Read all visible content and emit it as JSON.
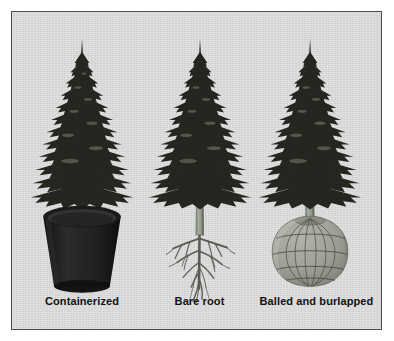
{
  "figure": {
    "background_color": "#d9d9d9",
    "border_color": "#4a4a4a",
    "outer_background": "#ffffff"
  },
  "colors": {
    "foliage_dark": "#23241f",
    "foliage_mid": "#3a3c33",
    "foliage_highlight": "#6d7063",
    "trunk": "#9aa091",
    "trunk_shadow": "#757b6d",
    "pot_dark": "#202020",
    "pot_rim": "#151515",
    "pot_soil": "#2c2c2c",
    "root_color": "#5d5f57",
    "burlap_fill": "#9fa198",
    "burlap_line": "#4e5048",
    "label_color": "#111111"
  },
  "panels": [
    {
      "id": "containerized",
      "label": "Containerized",
      "root_zone": "pot",
      "tree_center_x": 70,
      "tree_top_y": 28,
      "description": "Conifer growing in a dark tapered nursery container"
    },
    {
      "id": "bare-root",
      "label": "Bare root",
      "root_zone": "bare-roots",
      "tree_center_x": 58,
      "tree_top_y": 28,
      "description": "Conifer with exposed fibrous root system"
    },
    {
      "id": "balled-burlapped",
      "label": "Balled and burlapped",
      "root_zone": "burlap-ball",
      "tree_center_x": 60,
      "tree_top_y": 28,
      "description": "Conifer with root ball wrapped in burlap and twine"
    }
  ]
}
